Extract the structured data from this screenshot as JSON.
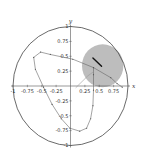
{
  "chart_data": {
    "type": "line",
    "title": "",
    "xlabel": "x",
    "ylabel": "y",
    "xlim": [
      -1,
      1
    ],
    "ylim": [
      -1,
      1
    ],
    "grid": false,
    "x_ticks": [
      "-1",
      "-0.75",
      "-0.5",
      "-0.25",
      "0.25",
      "0.5",
      "0.75"
    ],
    "y_ticks": [
      "1",
      "0.75",
      "0.5",
      "0.25",
      "-0.25",
      "-0.5",
      "-0.75",
      "-1"
    ],
    "unit_circle": {
      "center": [
        0,
        0
      ],
      "radius": 1,
      "color": "#444444"
    },
    "shaded_disk": {
      "center": [
        0.56,
        0.34
      ],
      "radius": 0.36,
      "color": "#bdbdbd"
    },
    "segment": {
      "from": [
        0.39,
        0.47
      ],
      "to": [
        0.54,
        0.33
      ],
      "color": "#111111"
    },
    "series": [
      {
        "name": "trajectory",
        "color": "#666666",
        "points": [
          [
            0.4,
            0.31
          ],
          [
            0.04,
            0.45
          ],
          [
            -0.35,
            0.53
          ],
          [
            -0.52,
            0.57
          ],
          [
            -0.64,
            0.48
          ],
          [
            -0.61,
            0.28
          ],
          [
            -0.47,
            -0.02
          ],
          [
            -0.32,
            -0.31
          ],
          [
            -0.16,
            -0.55
          ],
          [
            -0.01,
            -0.71
          ],
          [
            0.16,
            -0.76
          ],
          [
            0.28,
            -0.71
          ],
          [
            0.35,
            -0.55
          ],
          [
            0.39,
            -0.33
          ],
          [
            0.4,
            -0.07
          ],
          [
            0.4,
            0.19
          ],
          [
            0.4,
            0.31
          ],
          [
            0.7,
            0.14
          ],
          [
            0.81,
            0.04
          ],
          [
            0.9,
            -0.02
          ]
        ]
      },
      {
        "name": "return-segment",
        "color": "#999999",
        "points": [
          [
            0.09,
            -0.03
          ],
          [
            0.3,
            0.17
          ],
          [
            0.4,
            0.24
          ]
        ]
      }
    ]
  }
}
